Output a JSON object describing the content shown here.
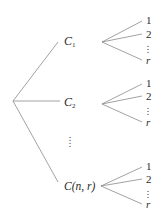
{
  "diagram": {
    "type": "tree",
    "root": {
      "label": ""
    },
    "level1": [
      {
        "id": "c1",
        "main": "C",
        "subscript": "1"
      },
      {
        "id": "c2",
        "main": "C",
        "subscript": "2"
      },
      {
        "id": "ellipsis",
        "main": "⋮"
      },
      {
        "id": "cnr",
        "main": "C(n, r)"
      }
    ],
    "leaves": {
      "labels": [
        "1",
        "2",
        "⋮",
        "r"
      ]
    },
    "line_color": "#8a8a8a",
    "text_color": "#2a2a2a"
  }
}
